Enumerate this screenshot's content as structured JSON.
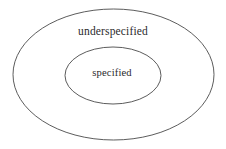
{
  "figure": {
    "type": "venn-diagram",
    "background_color": "#ffffff",
    "stroke_color": "#4a4a4a",
    "text_color": "#2b2b2b",
    "regions": [
      {
        "id": "outer",
        "label": "underspecified",
        "shape": "ellipse",
        "cx": 113.5,
        "cy": 74.5,
        "rx": 100.5,
        "ry": 65.5
      },
      {
        "id": "inner",
        "label": "specified",
        "shape": "ellipse",
        "cx": 113.0,
        "cy": 75.5,
        "rx": 48.0,
        "ry": 28.5
      }
    ]
  }
}
